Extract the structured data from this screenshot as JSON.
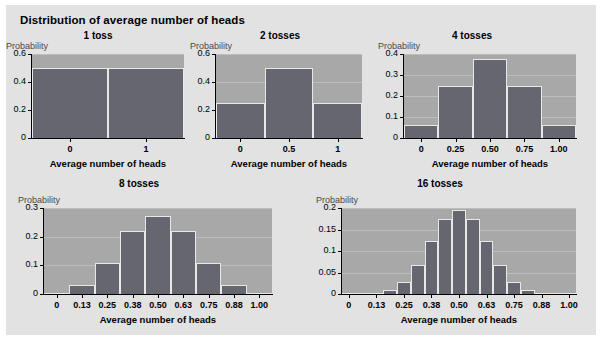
{
  "figure": {
    "title": "Distribution of average number of heads",
    "background_color": "#e2e2e2",
    "plot_background_color": "#a8a8a8",
    "bar_color": "#666670",
    "gridline_color": "#bdbdbd"
  },
  "chart_data": [
    {
      "type": "bar",
      "title": "1 toss",
      "xlabel": "Average number of heads",
      "ylabel": "Probability",
      "categories": [
        "0",
        "1"
      ],
      "x": [
        0,
        1
      ],
      "values": [
        0.5,
        0.5
      ],
      "ylim": [
        0,
        0.6
      ],
      "yticks": [
        0,
        0.2,
        0.4,
        0.6
      ],
      "ytick_labels": [
        "0",
        "0.2",
        "0.4",
        "0.6"
      ],
      "xticks": [
        0,
        1
      ],
      "xtick_labels": [
        "0",
        "1"
      ],
      "xlim": [
        -0.5,
        1.5
      ],
      "grid": true,
      "legend": "none"
    },
    {
      "type": "bar",
      "title": "2 tosses",
      "xlabel": "Average number of heads",
      "ylabel": "Probability",
      "categories": [
        "0",
        "0.5",
        "1"
      ],
      "x": [
        0,
        0.5,
        1
      ],
      "values": [
        0.25,
        0.5,
        0.25
      ],
      "ylim": [
        0,
        0.6
      ],
      "yticks": [
        0,
        0.2,
        0.4,
        0.6
      ],
      "ytick_labels": [
        "0",
        "0.2",
        "0.4",
        "0.6"
      ],
      "xticks": [
        0,
        0.5,
        1
      ],
      "xtick_labels": [
        "0",
        "0.5",
        "1"
      ],
      "xlim": [
        -0.25,
        1.25
      ],
      "grid": true,
      "legend": "none"
    },
    {
      "type": "bar",
      "title": "4 tosses",
      "xlabel": "Average number of heads",
      "ylabel": "Probability",
      "categories": [
        "0",
        "0.25",
        "0.50",
        "0.75",
        "1.00"
      ],
      "x": [
        0,
        0.25,
        0.5,
        0.75,
        1
      ],
      "values": [
        0.0625,
        0.25,
        0.375,
        0.25,
        0.0625
      ],
      "ylim": [
        0,
        0.4
      ],
      "yticks": [
        0,
        0.1,
        0.2,
        0.3,
        0.4
      ],
      "ytick_labels": [
        "0",
        "0.1",
        "0.2",
        "0.3",
        "0.4"
      ],
      "xticks": [
        0,
        0.25,
        0.5,
        0.75,
        1
      ],
      "xtick_labels": [
        "0",
        "0.25",
        "0.50",
        "0.75",
        "1.00"
      ],
      "xlim": [
        -0.125,
        1.125
      ],
      "grid": true,
      "legend": "none"
    },
    {
      "type": "bar",
      "title": "8 tosses",
      "xlabel": "Average number of heads",
      "ylabel": "Probability",
      "categories": [
        "0",
        "0.13",
        "0.25",
        "0.38",
        "0.50",
        "0.63",
        "0.75",
        "0.88",
        "1.00"
      ],
      "x": [
        0,
        0.125,
        0.25,
        0.375,
        0.5,
        0.625,
        0.75,
        0.875,
        1
      ],
      "values": [
        0.0039,
        0.0313,
        0.1094,
        0.2188,
        0.2734,
        0.2188,
        0.1094,
        0.0313,
        0.0039
      ],
      "ylim": [
        0,
        0.3
      ],
      "yticks": [
        0,
        0.1,
        0.2,
        0.3
      ],
      "ytick_labels": [
        "0",
        "0.1",
        "0.2",
        "0.3"
      ],
      "xticks": [
        0,
        0.125,
        0.25,
        0.375,
        0.5,
        0.625,
        0.75,
        0.875,
        1
      ],
      "xtick_labels": [
        "0",
        "0.13",
        "0.25",
        "0.38",
        "0.50",
        "0.63",
        "0.75",
        "0.88",
        "1.00"
      ],
      "xlim": [
        -0.0625,
        1.0625
      ],
      "grid": true,
      "legend": "none"
    },
    {
      "type": "bar",
      "title": "16 tosses",
      "xlabel": "Average number of heads",
      "ylabel": "Probability",
      "categories": [
        "0",
        "0.06",
        "0.13",
        "0.19",
        "0.25",
        "0.31",
        "0.38",
        "0.44",
        "0.50",
        "0.56",
        "0.63",
        "0.69",
        "0.75",
        "0.81",
        "0.88",
        "0.94",
        "1.00"
      ],
      "x": [
        0,
        0.0625,
        0.125,
        0.1875,
        0.25,
        0.3125,
        0.375,
        0.4375,
        0.5,
        0.5625,
        0.625,
        0.6875,
        0.75,
        0.8125,
        0.875,
        0.9375,
        1
      ],
      "values": [
        2e-05,
        0.00024,
        0.0018,
        0.0085,
        0.0278,
        0.0667,
        0.1222,
        0.1746,
        0.1964,
        0.1746,
        0.1222,
        0.0667,
        0.0278,
        0.0085,
        0.0018,
        0.00024,
        2e-05
      ],
      "ylim": [
        0,
        0.2
      ],
      "yticks": [
        0,
        0.05,
        0.1,
        0.15,
        0.2
      ],
      "ytick_labels": [
        "0",
        "0.05",
        "0.1",
        "0.15",
        "0.2"
      ],
      "xticks": [
        0,
        0.125,
        0.25,
        0.375,
        0.5,
        0.625,
        0.75,
        0.875,
        1
      ],
      "xtick_labels": [
        "0",
        "0.13",
        "0.25",
        "0.38",
        "0.50",
        "0.63",
        "0.75",
        "0.88",
        "1.00"
      ],
      "xlim": [
        -0.03125,
        1.03125
      ],
      "grid": true,
      "legend": "none"
    }
  ]
}
